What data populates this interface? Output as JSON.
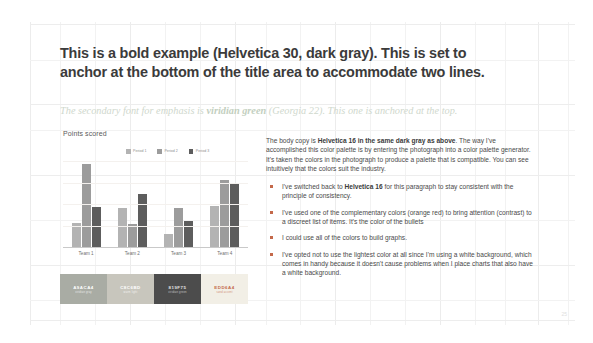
{
  "slide": {
    "title_lines": [
      "This is a bold example (Helvetica 30, dark gray). This is set to",
      "anchor at the bottom of the title area to accommodate two lines."
    ],
    "subtitle": {
      "before": "The secondary font for emphasis is ",
      "emphasis": "viridian green",
      "after": " (Georgia 22). This one is anchored at the top."
    },
    "page_number": "25"
  },
  "chart_data": {
    "type": "bar",
    "title": "Points scored",
    "xlabel": "",
    "ylabel": "",
    "ylim": [
      0,
      100
    ],
    "grid": true,
    "legend_position": "top",
    "categories": [
      "Team 1",
      "Team 2",
      "Team 3",
      "Team 4"
    ],
    "series": [
      {
        "name": "Period 1",
        "color": "#b3b3b3",
        "values": [
          28,
          45,
          15,
          48
        ]
      },
      {
        "name": "Period 2",
        "color": "#9c9c9c",
        "values": [
          96,
          27,
          45,
          78
        ]
      },
      {
        "name": "Period 3",
        "color": "#5d5d5d",
        "values": [
          47,
          62,
          30,
          74
        ]
      }
    ]
  },
  "palette": {
    "swatches": [
      {
        "hex": "#a9aca4",
        "label": "A9ACA4",
        "sublabel": "viridian gray",
        "text_color": "#ffffff"
      },
      {
        "hex": "#c8c6bd",
        "label": "C8C6BD",
        "sublabel": "warm light",
        "text_color": "#ffffff"
      },
      {
        "hex": "#4c4c4c",
        "label": "819F75",
        "sublabel": "viridian green",
        "text_color": "#e2e2e2"
      },
      {
        "hex": "#f2efe6",
        "label": "EDD6A4",
        "sublabel": "sand accent",
        "text_color": "#c4694a"
      }
    ]
  },
  "body": {
    "paragraph": {
      "p1": "The body copy is ",
      "b1": "Helvetica 16 in the same dark gray as above",
      "p2": ". The way I've accomplished this color palette is by entering the photograph into a color palette generator. It's taken the colors in the photograph to produce a palette that is compatible. You can see intuitively that the colors suit the industry."
    },
    "bullets": [
      {
        "p1": "I've switched back to ",
        "b1": "Helvetica 16",
        "p2": " for this paragraph to stay consistent with the principle of consistency."
      },
      {
        "p1": "I've used one of the complementary colors (orange red) to bring attention (contrast) to a discreet list of items. It's the color of the bullets",
        "b1": "",
        "p2": ""
      },
      {
        "p1": "I could use all of the colors to build graphs.",
        "b1": "",
        "p2": ""
      },
      {
        "p1": "I've opted not to use the lightest color at all since I'm using a white background, which comes in handy because it doesn't cause problems when I place charts that also have a white background.",
        "b1": "",
        "p2": ""
      }
    ]
  }
}
